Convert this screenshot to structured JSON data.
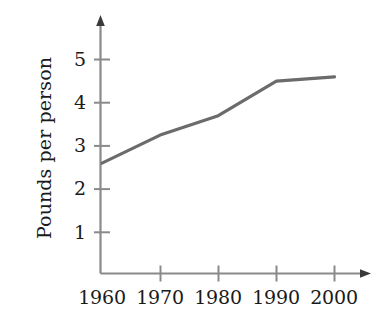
{
  "chart_data": {
    "type": "line",
    "title": "",
    "subtitle": "",
    "xlabel": "",
    "ylabel": "Pounds per person",
    "x": [
      1960,
      1970,
      1980,
      1990,
      2000
    ],
    "values": [
      2.6,
      3.25,
      3.7,
      4.5,
      4.6
    ],
    "series": [
      {
        "name": "Pounds per person",
        "values": [
          2.6,
          3.25,
          3.7,
          4.5,
          4.6
        ],
        "color": "#6b6b6b"
      }
    ],
    "xlim": [
      1960,
      2000
    ],
    "ylim": [
      0,
      5.45
    ],
    "x_tick_labels": [
      "1960",
      "1970",
      "1980",
      "1990",
      "2000"
    ],
    "y_tick_labels": [
      "1",
      "2",
      "3",
      "4",
      "5"
    ],
    "y_ticks": [
      1,
      2,
      3,
      4,
      5
    ],
    "grid": false,
    "legend": "none",
    "axis_arrows": true,
    "annotations": []
  },
  "axes": {
    "y_axis_title": "Pounds per person",
    "x_axis_title": "",
    "line_color": "#6b6b6b",
    "axis_color": "#8a8a8a",
    "text_color": "#1a1a1a",
    "background": "#ffffff"
  },
  "y_tick_labels": {
    "t1": "1",
    "t2": "2",
    "t3": "3",
    "t4": "4",
    "t5": "5"
  },
  "x_tick_labels": {
    "t1960": "1960",
    "t1970": "1970",
    "t1980": "1980",
    "t1990": "1990",
    "t2000": "2000"
  }
}
